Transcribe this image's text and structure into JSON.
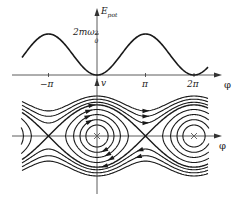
{
  "top_plot": {
    "y_axis_label_main": "E",
    "y_axis_label_sub": "pot",
    "peak_label_main": "2mω",
    "peak_label_sup": "2",
    "peak_label_sub": "0",
    "x_axis_label": "φ",
    "x_ticks": [
      "−π",
      "π",
      "2π"
    ]
  },
  "phase_plot": {
    "y_axis_label": "v",
    "x_axis_label": "φ"
  },
  "geometry": {
    "origin_x": 97,
    "pi_px": 48.5,
    "top_axis_y": 75,
    "top_peak_y": 34,
    "phase_axis_y": 136,
    "curve_x_min": 22,
    "curve_x_max": 208,
    "phase_scale": 22
  },
  "chart_data": {
    "type": "line",
    "series": [
      {
        "name": "E_pot(φ) = mω0²(1 − cos φ)",
        "x_range": [
          -4.8,
          7.2
        ],
        "min": 0,
        "max": "2mω0²"
      }
    ],
    "phase_levels_libration": [
      0.25,
      0.55,
      0.95,
      1.45
    ],
    "phase_level_separatrix": 2.0,
    "phase_levels_rotation": [
      2.35,
      2.8,
      3.3
    ],
    "centers": [
      "0",
      "2π"
    ],
    "saddles": [
      "−π",
      "π"
    ],
    "xlabel": "φ",
    "ylabel_top": "E_pot",
    "ylabel_bottom": "v"
  },
  "colors": {
    "line": "#1a1a1a",
    "axis": "#333333"
  }
}
